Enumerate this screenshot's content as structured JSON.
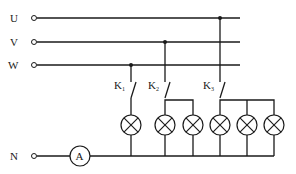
{
  "diagram": {
    "type": "three-phase four-wire lighting circuit",
    "lines": [
      {
        "id": "U",
        "label": "U"
      },
      {
        "id": "V",
        "label": "V"
      },
      {
        "id": "W",
        "label": "W"
      }
    ],
    "neutral": {
      "label": "N"
    },
    "ammeter": {
      "label": "A"
    },
    "switches": [
      {
        "id": "K1",
        "label": "K",
        "subscript": "1",
        "phase": "W",
        "lamp_count": 1
      },
      {
        "id": "K2",
        "label": "K",
        "subscript": "2",
        "phase": "V",
        "lamp_count": 2
      },
      {
        "id": "K3",
        "label": "K",
        "subscript": "3",
        "phase": "U",
        "lamp_count": 3
      }
    ],
    "lamp_symbol": "circle-with-cross",
    "colors": {
      "line": "#1a1a1a",
      "background": "#ffffff"
    }
  }
}
